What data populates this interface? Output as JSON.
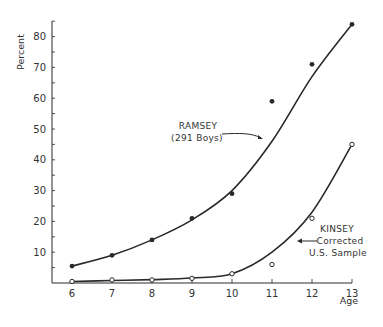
{
  "chart_data": {
    "type": "line",
    "title": "",
    "xlabel": "Age",
    "ylabel": "Percent",
    "x": [
      6,
      7,
      8,
      9,
      10,
      11,
      12,
      13
    ],
    "xlim": [
      5.5,
      13
    ],
    "ylim": [
      0,
      87
    ],
    "yticks": [
      10,
      20,
      30,
      40,
      50,
      60,
      70,
      80
    ],
    "xticks": [
      6,
      7,
      8,
      9,
      10,
      11,
      12,
      13
    ],
    "grid": false,
    "legend": "none (inline annotations with arrows)",
    "series": [
      {
        "name": "RAMSEY (291 Boys)",
        "marker": "filled-circle",
        "values": [
          5.5,
          9,
          14,
          21,
          29,
          59,
          71,
          84
        ],
        "curve": [
          5.5,
          9,
          14,
          20.5,
          30,
          46,
          67,
          84
        ]
      },
      {
        "name": "KINSEY Corrected U.S. Sample",
        "marker": "open-circle",
        "values": [
          0.5,
          1,
          1,
          1.5,
          3,
          6,
          21,
          45
        ],
        "curve": [
          0.5,
          0.8,
          1.1,
          1.6,
          3,
          10,
          23,
          45
        ]
      }
    ],
    "annotations": [
      {
        "lines": [
          "RAMSEY",
          "(291 Boys)"
        ],
        "points_to": "RAMSEY curve near age 11"
      },
      {
        "lines": [
          "KINSEY",
          "Corrected",
          "U.S. Sample"
        ],
        "points_to": "KINSEY curve near age 11.6"
      }
    ]
  },
  "labels": {
    "ylabel": "Percent",
    "xlabel": "Age",
    "ramsey_line1": "RAMSEY",
    "ramsey_line2": "(291 Boys)",
    "kinsey_line1": "KINSEY",
    "kinsey_line2": "Corrected",
    "kinsey_line3": "U.S. Sample"
  },
  "colors": {
    "ink": "#2a2a2a",
    "background": "#ffffff"
  }
}
